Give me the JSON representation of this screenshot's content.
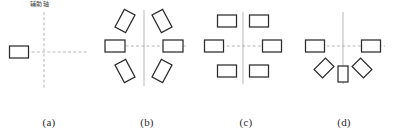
{
  "figure": {
    "background_color": "#ffffff",
    "stroke_color": "#2b2b2b",
    "axis_color": "#9a9a9a",
    "panel_count": 4
  },
  "annotation": {
    "axis_label_text": "辅助轴",
    "axis_label_panel": "a"
  },
  "panels": [
    {
      "id": "a",
      "caption": "(a)",
      "center_x": 44,
      "center_y": 52,
      "axes": {
        "horizontal": {
          "x1": 16,
          "x2": 88,
          "y": 52,
          "style": "dashed"
        },
        "vertical": {
          "y1": 12,
          "y2": 90,
          "x": 44,
          "style": "dashed"
        }
      },
      "shapes": [
        {
          "name": "rect-left",
          "cx": 19,
          "cy": 52,
          "w": 19,
          "h": 12,
          "rotation": 0
        }
      ]
    },
    {
      "id": "b",
      "caption": "(b)",
      "center_x": 46,
      "center_y": 46,
      "axes": {
        "horizontal": {
          "x1": 12,
          "x2": 88,
          "y": 46,
          "style": "dashed"
        },
        "vertical": {
          "y1": 10,
          "y2": 86,
          "x": 46,
          "style": "solid"
        }
      },
      "shapes": [
        {
          "name": "rect-left",
          "cx": 17,
          "cy": 46,
          "w": 20,
          "h": 12,
          "rotation": 0
        },
        {
          "name": "rect-right",
          "cx": 75,
          "cy": 46,
          "w": 20,
          "h": 12,
          "rotation": 0
        },
        {
          "name": "rect-upper-left",
          "cx": 27,
          "cy": 21,
          "w": 20,
          "h": 12,
          "rotation": -62
        },
        {
          "name": "rect-upper-right",
          "cx": 64,
          "cy": 21,
          "w": 20,
          "h": 12,
          "rotation": 62
        },
        {
          "name": "rect-lower-left",
          "cx": 27,
          "cy": 71,
          "w": 20,
          "h": 12,
          "rotation": 62
        },
        {
          "name": "rect-lower-right",
          "cx": 64,
          "cy": 71,
          "w": 20,
          "h": 12,
          "rotation": -62
        }
      ]
    },
    {
      "id": "c",
      "caption": "(c)",
      "center_x": 46,
      "center_y": 46,
      "axes": {
        "horizontal": {
          "x1": 14,
          "x2": 86,
          "y": 46,
          "style": "dashed"
        },
        "vertical": {
          "y1": 12,
          "y2": 84,
          "x": 46,
          "style": "solid"
        }
      },
      "shapes": [
        {
          "name": "rect-left",
          "cx": 17,
          "cy": 46,
          "w": 19,
          "h": 12,
          "rotation": 0
        },
        {
          "name": "rect-right",
          "cx": 75,
          "cy": 46,
          "w": 19,
          "h": 12,
          "rotation": 0
        },
        {
          "name": "rect-upper-left",
          "cx": 30,
          "cy": 21,
          "w": 19,
          "h": 12,
          "rotation": 0
        },
        {
          "name": "rect-upper-right",
          "cx": 62,
          "cy": 21,
          "w": 19,
          "h": 12,
          "rotation": 0
        },
        {
          "name": "rect-lower-left",
          "cx": 30,
          "cy": 71,
          "w": 19,
          "h": 12,
          "rotation": 0
        },
        {
          "name": "rect-lower-right",
          "cx": 62,
          "cy": 71,
          "w": 19,
          "h": 12,
          "rotation": 0
        }
      ]
    },
    {
      "id": "d",
      "caption": "(d)",
      "center_x": 48,
      "center_y": 46,
      "axes": {
        "horizontal": {
          "x1": 16,
          "x2": 90,
          "y": 46,
          "style": "dashed"
        },
        "vertical": {
          "y1": 12,
          "y2": 84,
          "x": 48,
          "style": "solid"
        }
      },
      "shapes": [
        {
          "name": "rect-left",
          "cx": 20,
          "cy": 46,
          "w": 19,
          "h": 12,
          "rotation": 0
        },
        {
          "name": "rect-right",
          "cx": 76,
          "cy": 46,
          "w": 19,
          "h": 12,
          "rotation": 0
        },
        {
          "name": "diamond-lower-left",
          "cx": 29,
          "cy": 68,
          "w": 16,
          "h": 12,
          "rotation": -45
        },
        {
          "name": "diamond-lower-right",
          "cx": 67,
          "cy": 68,
          "w": 16,
          "h": 12,
          "rotation": 45
        },
        {
          "name": "rect-bottom-center",
          "cx": 48,
          "cy": 74,
          "w": 10,
          "h": 16,
          "rotation": 0
        }
      ]
    }
  ]
}
